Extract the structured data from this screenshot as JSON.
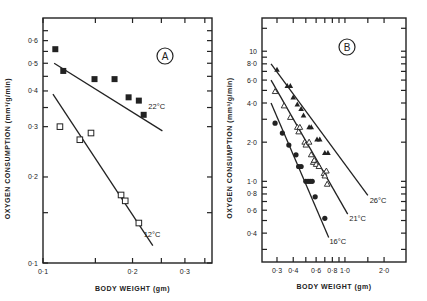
{
  "figure": {
    "background": "#ffffff",
    "ink": "#222222"
  },
  "chart_data": [
    {
      "panel": "A",
      "type": "scatter",
      "title": "A",
      "xlabel": "BODY  WEIGHT (gm)",
      "ylabel": "OXYGEN CONSUMPTION (mm³/g/min)",
      "xscale": "log",
      "yscale": "log",
      "xlim": [
        0.1,
        0.37
      ],
      "ylim": [
        0.1,
        0.72
      ],
      "xticks": [
        {
          "v": 0.1,
          "label": "0·1"
        },
        {
          "v": 0.15,
          "label": ""
        },
        {
          "v": 0.2,
          "label": "0·2"
        },
        {
          "v": 0.25,
          "label": ""
        },
        {
          "v": 0.3,
          "label": "0·3"
        },
        {
          "v": 0.35,
          "label": ""
        }
      ],
      "yticks": [
        {
          "v": 0.1,
          "label": "0·1"
        },
        {
          "v": 0.15,
          "label": ""
        },
        {
          "v": 0.2,
          "label": "0·2"
        },
        {
          "v": 0.3,
          "label": "0·3"
        },
        {
          "v": 0.35,
          "label": ""
        },
        {
          "v": 0.4,
          "label": "0·4"
        },
        {
          "v": 0.45,
          "label": ""
        },
        {
          "v": 0.5,
          "label": "0·5"
        },
        {
          "v": 0.55,
          "label": ""
        },
        {
          "v": 0.6,
          "label": "0·6"
        },
        {
          "v": 0.65,
          "label": ""
        }
      ],
      "grid": false,
      "series": [
        {
          "name": "22°C",
          "marker": "filled-square",
          "points": [
            [
              0.11,
              0.56
            ],
            [
              0.117,
              0.47
            ],
            [
              0.149,
              0.44
            ],
            [
              0.174,
              0.44
            ],
            [
              0.194,
              0.38
            ],
            [
              0.21,
              0.37
            ],
            [
              0.218,
              0.33
            ]
          ],
          "fit": [
            [
              0.109,
              0.5
            ],
            [
              0.252,
              0.29
            ]
          ],
          "label_at": [
            0.226,
            0.355
          ]
        },
        {
          "name": "12°C",
          "marker": "open-square",
          "points": [
            [
              0.114,
              0.3
            ],
            [
              0.133,
              0.27
            ],
            [
              0.145,
              0.285
            ],
            [
              0.183,
              0.173
            ],
            [
              0.189,
              0.165
            ],
            [
              0.21,
              0.138
            ]
          ],
          "fit": [
            [
              0.108,
              0.39
            ],
            [
              0.234,
              0.115
            ]
          ],
          "label_at": [
            0.218,
            0.126
          ]
        }
      ]
    },
    {
      "panel": "B",
      "type": "scatter",
      "title": "B",
      "xlabel": "BODY  WEIGHT (gm)",
      "ylabel": "OXYGEN CONSUMPTION (mm³/g/min)",
      "xscale": "log",
      "yscale": "log",
      "xlim": [
        0.23,
        2.95
      ],
      "ylim": [
        0.24,
        18
      ],
      "xticks": [
        {
          "v": 0.3,
          "label": "0·3"
        },
        {
          "v": 0.4,
          "label": "0·4"
        },
        {
          "v": 0.5,
          "label": ""
        },
        {
          "v": 0.6,
          "label": "0·6"
        },
        {
          "v": 0.7,
          "label": ""
        },
        {
          "v": 0.8,
          "label": "0·8"
        },
        {
          "v": 0.9,
          "label": ""
        },
        {
          "v": 1.0,
          "label": "1·0"
        },
        {
          "v": 1.5,
          "label": ""
        },
        {
          "v": 2.0,
          "label": "2·0"
        }
      ],
      "yticks": [
        {
          "v": 0.3,
          "label": ""
        },
        {
          "v": 0.4,
          "label": "0·4"
        },
        {
          "v": 0.5,
          "label": ""
        },
        {
          "v": 0.6,
          "label": "0·6"
        },
        {
          "v": 0.7,
          "label": ""
        },
        {
          "v": 0.8,
          "label": "0·8"
        },
        {
          "v": 0.9,
          "label": ""
        },
        {
          "v": 1.0,
          "label": "1·0"
        },
        {
          "v": 2.0,
          "label": "2·0"
        },
        {
          "v": 3.0,
          "label": ""
        },
        {
          "v": 4.0,
          "label": "4·0"
        },
        {
          "v": 5.0,
          "label": ""
        },
        {
          "v": 6.0,
          "label": "6·0"
        },
        {
          "v": 7.0,
          "label": ""
        },
        {
          "v": 8.0,
          "label": "8·0"
        },
        {
          "v": 9.0,
          "label": ""
        },
        {
          "v": 10,
          "label": "10"
        },
        {
          "v": 15,
          "label": ""
        }
      ],
      "grid": false,
      "series": [
        {
          "name": "26°C",
          "marker": "filled-triangle",
          "points": [
            [
              0.3,
              7.2
            ],
            [
              0.36,
              5.4
            ],
            [
              0.38,
              5.4
            ],
            [
              0.4,
              4.4
            ],
            [
              0.43,
              3.9
            ],
            [
              0.46,
              3.6
            ],
            [
              0.48,
              3.2
            ],
            [
              0.53,
              2.6
            ],
            [
              0.55,
              2.6
            ],
            [
              0.61,
              2.1
            ],
            [
              0.64,
              2.1
            ],
            [
              0.7,
              1.65
            ],
            [
              0.74,
              1.65
            ]
          ],
          "fit": [
            [
              0.27,
              8.0
            ],
            [
              1.5,
              0.78
            ]
          ],
          "label_at": [
            1.55,
            0.72
          ]
        },
        {
          "name": "21°C",
          "marker": "open-triangle",
          "points": [
            [
              0.29,
              4.9
            ],
            [
              0.34,
              3.8
            ],
            [
              0.38,
              3.1
            ],
            [
              0.43,
              2.6
            ],
            [
              0.44,
              2.4
            ],
            [
              0.45,
              2.6
            ],
            [
              0.49,
              2.0
            ],
            [
              0.5,
              1.9
            ],
            [
              0.53,
              2.0
            ],
            [
              0.55,
              1.6
            ],
            [
              0.57,
              1.4
            ],
            [
              0.58,
              1.45
            ],
            [
              0.6,
              1.35
            ],
            [
              0.63,
              1.3
            ],
            [
              0.69,
              1.15
            ],
            [
              0.72,
              1.2
            ],
            [
              0.7,
              1.1
            ],
            [
              0.73,
              0.95
            ]
          ],
          "fit": [
            [
              0.27,
              6.0
            ],
            [
              1.05,
              0.56
            ]
          ],
          "label_at": [
            1.08,
            0.52
          ]
        },
        {
          "name": "16°C",
          "marker": "filled-circle",
          "points": [
            [
              0.29,
              2.8
            ],
            [
              0.33,
              2.35
            ],
            [
              0.37,
              1.9
            ],
            [
              0.42,
              1.6
            ],
            [
              0.44,
              1.3
            ],
            [
              0.46,
              1.3
            ],
            [
              0.5,
              1.0
            ],
            [
              0.52,
              1.0
            ],
            [
              0.54,
              1.0
            ],
            [
              0.56,
              1.0
            ],
            [
              0.59,
              0.76
            ],
            [
              0.7,
              0.52
            ]
          ],
          "fit": [
            [
              0.27,
              4.0
            ],
            [
              0.75,
              0.37
            ]
          ],
          "label_at": [
            0.76,
            0.35
          ]
        }
      ]
    }
  ]
}
